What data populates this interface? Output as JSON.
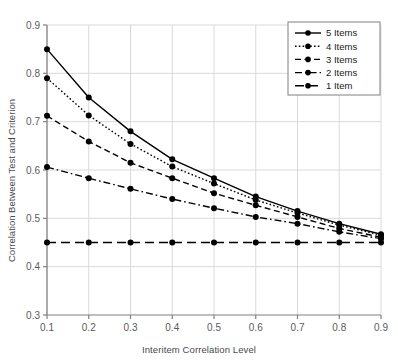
{
  "chart_data": {
    "type": "line",
    "title": "",
    "xlabel": "Interitem Correlation Level",
    "ylabel": "Correlation Between Test and Criterion",
    "x": [
      0.1,
      0.2,
      0.3,
      0.4,
      0.5,
      0.6,
      0.7,
      0.8,
      0.9
    ],
    "xticklabels": [
      "0.1",
      "0.2",
      "0.3",
      "0.4",
      "0.5",
      "0.6",
      "0.7",
      "0.8",
      "0.9"
    ],
    "yticklabels": [
      "0.3",
      "0.4",
      "0.5",
      "0.6",
      "0.7",
      "0.8",
      "0.9"
    ],
    "xlim": [
      0.1,
      0.9
    ],
    "ylim": [
      0.3,
      0.9
    ],
    "ytick_step": 0.1,
    "grid": true,
    "legend_position": "top-right",
    "series": [
      {
        "name": "5 Items",
        "style": "solid",
        "values": [
          0.85,
          0.75,
          0.68,
          0.622,
          0.583,
          0.545,
          0.515,
          0.489,
          0.467
        ]
      },
      {
        "name": "4 Items",
        "style": "dotted",
        "values": [
          0.79,
          0.713,
          0.654,
          0.607,
          0.572,
          0.538,
          0.511,
          0.486,
          0.465
        ]
      },
      {
        "name": "3 Items",
        "style": "dashed",
        "values": [
          0.712,
          0.659,
          0.615,
          0.583,
          0.552,
          0.527,
          0.503,
          0.479,
          0.461
        ]
      },
      {
        "name": "2 Items",
        "style": "dash-dot",
        "values": [
          0.606,
          0.583,
          0.561,
          0.54,
          0.521,
          0.503,
          0.489,
          0.472,
          0.458
        ]
      },
      {
        "name": "1 Item",
        "style": "long-dash",
        "values": [
          0.45,
          0.45,
          0.45,
          0.45,
          0.45,
          0.45,
          0.45,
          0.45,
          0.45
        ]
      }
    ]
  },
  "colors": {
    "line": "#000000",
    "grid": "#d9d9d9",
    "axis": "#808080",
    "tick_text": "#5a5a5a",
    "axis_title": "#4a4a4a",
    "legend_border": "#808080",
    "background": "#ffffff"
  }
}
